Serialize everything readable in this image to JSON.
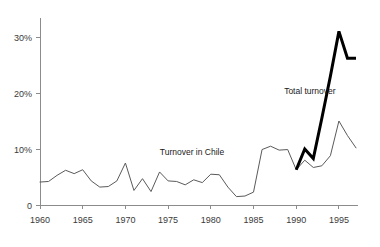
{
  "chart_data": {
    "type": "line",
    "title": "",
    "subtitle": "",
    "xlabel": "",
    "ylabel": "",
    "xlim": [
      1960,
      1997
    ],
    "ylim": [
      0,
      33
    ],
    "grid": false,
    "legend_position": "inline-annotations",
    "x_tick_labels": [
      "1960",
      "1965",
      "1970",
      "1975",
      "1980",
      "1985",
      "1990",
      "1995"
    ],
    "x_ticks": [
      1960,
      1965,
      1970,
      1975,
      1980,
      1985,
      1990,
      1995
    ],
    "y_tick_labels": [
      "0",
      "10%",
      "20%",
      "30%"
    ],
    "y_ticks": [
      0,
      10,
      20,
      30
    ],
    "annotations": [
      {
        "name": "total-turnover",
        "text": "Total turnover",
        "x": 1991.6,
        "y": 19.8
      },
      {
        "name": "turnover-in-chile",
        "text": "Turnover in Chile",
        "x": 1977.8,
        "y": 9.0
      }
    ],
    "series": [
      {
        "name": "Turnover in Chile",
        "style": "thin",
        "color": "#5a5a5a",
        "x": [
          1960,
          1961,
          1962,
          1963,
          1964,
          1965,
          1966,
          1967,
          1968,
          1969,
          1970,
          1971,
          1972,
          1973,
          1974,
          1975,
          1976,
          1977,
          1978,
          1979,
          1980,
          1981,
          1982,
          1983,
          1984,
          1985,
          1986,
          1987,
          1988,
          1989,
          1990,
          1991,
          1992,
          1993,
          1994,
          1995,
          1996,
          1997
        ],
        "values": [
          4.1,
          4.2,
          5.3,
          6.2,
          5.6,
          6.3,
          4.3,
          3.2,
          3.3,
          4.3,
          7.5,
          2.6,
          4.7,
          2.4,
          5.9,
          4.3,
          4.2,
          3.6,
          4.5,
          4.0,
          5.5,
          5.4,
          3.2,
          1.5,
          1.6,
          2.3,
          9.9,
          10.5,
          9.8,
          9.9,
          6.3,
          8.0,
          6.7,
          7.0,
          8.8,
          15.0,
          12.4,
          10.2
        ]
      },
      {
        "name": "Total turnover",
        "style": "thick",
        "color": "#000000",
        "x": [
          1990,
          1991,
          1992,
          1993,
          1994,
          1995,
          1996,
          1997
        ],
        "values": [
          6.3,
          10.0,
          8.3,
          15.5,
          23.0,
          31.0,
          26.2,
          26.2
        ]
      }
    ]
  }
}
